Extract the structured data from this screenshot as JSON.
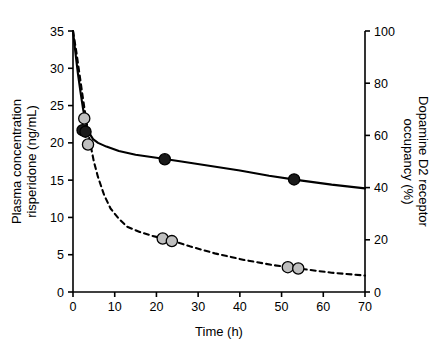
{
  "chart_data": {
    "type": "line",
    "title": "",
    "xlabel": "Time (h)",
    "ylabel": "Plasma concentration risperidone (ng/mL)",
    "y2label": "Dopamine D2 receptor occupancy (%)",
    "xlim": [
      0,
      70
    ],
    "xticks": [
      0,
      10,
      20,
      30,
      40,
      50,
      60,
      70
    ],
    "xticklabels": [
      "0",
      "10",
      "20",
      "30",
      "40",
      "50",
      "60",
      "70"
    ],
    "ylim": [
      0,
      35
    ],
    "yticks": [
      0,
      5,
      10,
      15,
      20,
      25,
      30,
      35
    ],
    "yticklabels": [
      "0",
      "5",
      "10",
      "15",
      "20",
      "25",
      "30",
      "35"
    ],
    "y2lim": [
      0,
      100
    ],
    "y2ticks": [
      0,
      20,
      40,
      60,
      80,
      100
    ],
    "y2ticklabels": [
      "0",
      "20",
      "40",
      "60",
      "80",
      "100"
    ],
    "grid": false,
    "legend": "none",
    "series": [
      {
        "name": "Plasma concentration risperidone",
        "axis": "left",
        "style": "solid",
        "color": "#000000",
        "marker": "filled-circle",
        "marker_color": "#1a1a1a",
        "curve": [
          {
            "x": 0.0,
            "y": 35.0
          },
          {
            "x": 0.6,
            "y": 32.0
          },
          {
            "x": 1.2,
            "y": 29.2
          },
          {
            "x": 1.8,
            "y": 26.8
          },
          {
            "x": 2.4,
            "y": 24.6
          },
          {
            "x": 3.0,
            "y": 22.8
          },
          {
            "x": 3.8,
            "y": 21.4
          },
          {
            "x": 4.8,
            "y": 20.5
          },
          {
            "x": 6.0,
            "y": 20.0
          },
          {
            "x": 8.0,
            "y": 19.5
          },
          {
            "x": 11.0,
            "y": 18.9
          },
          {
            "x": 15.0,
            "y": 18.4
          },
          {
            "x": 20.0,
            "y": 18.0
          },
          {
            "x": 26.0,
            "y": 17.5
          },
          {
            "x": 33.0,
            "y": 16.9
          },
          {
            "x": 40.0,
            "y": 16.3
          },
          {
            "x": 47.0,
            "y": 15.6
          },
          {
            "x": 54.0,
            "y": 15.0
          },
          {
            "x": 62.0,
            "y": 14.4
          },
          {
            "x": 70.0,
            "y": 13.9
          }
        ],
        "points": [
          {
            "x": 2.3,
            "y": 21.7
          },
          {
            "x": 3.0,
            "y": 21.5
          },
          {
            "x": 22.0,
            "y": 17.8
          },
          {
            "x": 53.0,
            "y": 15.1
          }
        ]
      },
      {
        "name": "Dopamine D2 receptor occupancy",
        "axis": "right",
        "style": "dashed",
        "color": "#000000",
        "marker": "grey-circle",
        "marker_color": "#bfbfbf",
        "curve": [
          {
            "x": 0.0,
            "y": 100.0
          },
          {
            "x": 0.8,
            "y": 92.0
          },
          {
            "x": 1.6,
            "y": 83.0
          },
          {
            "x": 2.4,
            "y": 74.0
          },
          {
            "x": 3.2,
            "y": 65.5
          },
          {
            "x": 4.0,
            "y": 58.0
          },
          {
            "x": 5.0,
            "y": 50.0
          },
          {
            "x": 6.0,
            "y": 44.0
          },
          {
            "x": 7.5,
            "y": 37.0
          },
          {
            "x": 9.0,
            "y": 32.0
          },
          {
            "x": 11.0,
            "y": 28.0
          },
          {
            "x": 13.0,
            "y": 25.0
          },
          {
            "x": 16.0,
            "y": 23.0
          },
          {
            "x": 19.0,
            "y": 21.5
          },
          {
            "x": 23.0,
            "y": 20.0
          },
          {
            "x": 28.0,
            "y": 17.5
          },
          {
            "x": 34.0,
            "y": 14.8
          },
          {
            "x": 41.0,
            "y": 12.3
          },
          {
            "x": 48.0,
            "y": 10.3
          },
          {
            "x": 55.0,
            "y": 8.8
          },
          {
            "x": 62.0,
            "y": 7.4
          },
          {
            "x": 70.0,
            "y": 6.3
          }
        ],
        "points": [
          {
            "x": 2.7,
            "y": 66.5
          },
          {
            "x": 3.6,
            "y": 56.5
          },
          {
            "x": 21.5,
            "y": 20.5
          },
          {
            "x": 23.7,
            "y": 19.5
          },
          {
            "x": 51.5,
            "y": 9.5
          },
          {
            "x": 54.0,
            "y": 9.0
          }
        ]
      }
    ]
  }
}
